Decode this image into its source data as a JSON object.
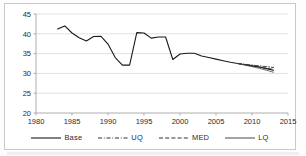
{
  "chart_data": {
    "type": "line",
    "title": "",
    "subtitle": "",
    "xlabel": "",
    "ylabel": "",
    "xlim": [
      1980,
      2015
    ],
    "ylim": [
      20,
      45
    ],
    "grid": "horizontal",
    "legend_position": "bottom",
    "xticks": [
      "1980",
      "1985",
      "1990",
      "1995",
      "2000",
      "2005",
      "2010",
      "2015"
    ],
    "xtick_values": [
      1980,
      1985,
      1990,
      1995,
      2000,
      2005,
      2010,
      2015
    ],
    "yticks": [
      "20",
      "25",
      "30",
      "35",
      "40",
      "45"
    ],
    "ytick_values": [
      20,
      25,
      30,
      35,
      40,
      45
    ],
    "series": [
      {
        "name": "Base",
        "style": "solid",
        "color": "#1a1a1a",
        "width": 1.1,
        "x": [
          1983,
          1984,
          1985,
          1986,
          1987,
          1988,
          1989,
          1990,
          1991,
          1992,
          1993,
          1994,
          1995,
          1996,
          1997,
          1998,
          1999,
          2000,
          2001,
          2002,
          2003,
          2004,
          2005,
          2006,
          2007,
          2008,
          2009,
          2010,
          2011,
          2012,
          2013
        ],
        "values": [
          41.2,
          42.0,
          40.2,
          39.0,
          38.2,
          39.3,
          39.4,
          37.4,
          34.0,
          32.1,
          32.1,
          40.3,
          40.2,
          38.9,
          39.2,
          39.2,
          33.5,
          34.9,
          35.1,
          35.1,
          34.4,
          34.0,
          33.6,
          33.2,
          32.8,
          32.5,
          32.2,
          31.9,
          31.6,
          31.2,
          30.8
        ]
      },
      {
        "name": "UQ",
        "style": "dash-dot",
        "color": "#2b2b2b",
        "width": 0.9,
        "x": [
          2008,
          2009,
          2010,
          2011,
          2012,
          2013
        ],
        "values": [
          32.5,
          32.3,
          32.1,
          31.9,
          31.7,
          31.5
        ]
      },
      {
        "name": "MED",
        "style": "dashed",
        "color": "#2b2b2b",
        "width": 0.9,
        "x": [
          2008,
          2009,
          2010,
          2011,
          2012,
          2013
        ],
        "values": [
          32.5,
          32.2,
          31.9,
          31.6,
          31.3,
          31.0
        ]
      },
      {
        "name": "LQ",
        "style": "solid",
        "color": "#4a4a4a",
        "width": 0.8,
        "x": [
          2008,
          2009,
          2010,
          2011,
          2012,
          2013
        ],
        "values": [
          32.5,
          32.1,
          31.7,
          31.3,
          30.8,
          30.3
        ]
      }
    ]
  },
  "legend": {
    "items": [
      {
        "label": "Base",
        "style": "solid"
      },
      {
        "label": "UQ",
        "style": "dash-dot"
      },
      {
        "label": "MED",
        "style": "dashed"
      },
      {
        "label": "LQ",
        "style": "solid-thin"
      }
    ]
  }
}
